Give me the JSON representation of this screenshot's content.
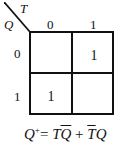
{
  "kmap": {
    "row_variable": "Q",
    "col_variable": "T",
    "col_headers": [
      "0",
      "1"
    ],
    "row_headers": [
      "0",
      "1"
    ],
    "cells": [
      [
        "",
        "1"
      ],
      [
        "1",
        ""
      ]
    ]
  },
  "equation": {
    "lhs": "Q",
    "sup": "+",
    "eq": "= ",
    "t1a": "T",
    "t1b": "Q",
    "plus": " + ",
    "t2a": "T",
    "t2b": "Q"
  }
}
